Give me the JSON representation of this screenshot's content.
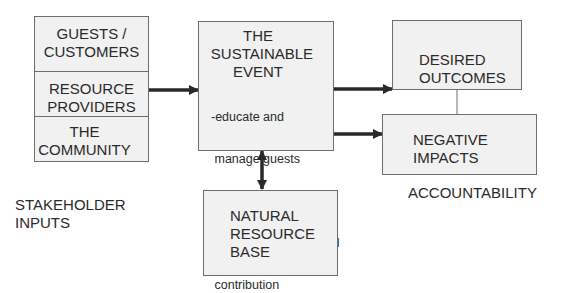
{
  "diagram": {
    "stakeholders": {
      "items": [
        {
          "label": "GUESTS / CUSTOMERS",
          "line1": "GUESTS /",
          "line2": "CUSTOMERS"
        },
        {
          "label": "RESOURCE PROVIDERS",
          "line1": "RESOURCE",
          "line2": "PROVIDERS"
        },
        {
          "label": "THE COMMUNITY",
          "line1": "THE",
          "line2": "COMMUNITY"
        }
      ],
      "caption_line1": "STAKEHOLDER",
      "caption_line2": "INPUTS"
    },
    "event": {
      "title_line1": "THE",
      "title_line2": "SUSTAINABLE",
      "title_line3": "EVENT",
      "bullets": [
        "-educate and",
        " manage guests",
        "-green operations",
        "-positive environmental",
        " contribution"
      ]
    },
    "natural_resource": {
      "line1": "NATURAL",
      "line2": "RESOURCE",
      "line3": "BASE"
    },
    "outcomes": {
      "desired_line1": "DESIRED",
      "desired_line2": "OUTCOMES",
      "negative_line1": "NEGATIVE",
      "negative_line2": "IMPACTS",
      "caption": "ACCOUNTABILITY"
    },
    "colors": {
      "box_fill": "#f1f1f1",
      "box_border": "#6e6e6e",
      "arrow": "#2a2a2a",
      "text": "#2a2a2a"
    }
  }
}
